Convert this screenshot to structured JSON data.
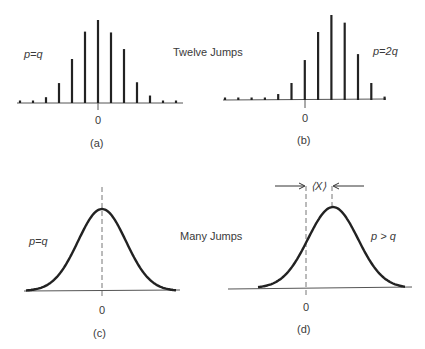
{
  "title_top": "Twelve Jumps",
  "title_bottom": "Many Jumps",
  "chart_data": [
    {
      "type": "bar",
      "panel": "(a)",
      "annotation": "p=q",
      "zero_label": "0",
      "categories": [
        -6,
        -5,
        -4,
        -3,
        -2,
        -1,
        0,
        1,
        2,
        3,
        4,
        5,
        6
      ],
      "values": [
        0.02,
        0.02,
        0.07,
        0.24,
        0.53,
        0.86,
        1.0,
        0.85,
        0.65,
        0.25,
        0.09,
        0.03,
        0.03
      ]
    },
    {
      "type": "bar",
      "panel": "(b)",
      "annotation": "p=2q",
      "zero_label": "0",
      "categories": [
        -6,
        -5,
        -4,
        -3,
        -2,
        -1,
        0,
        1,
        2,
        3,
        4,
        5,
        6
      ],
      "values": [
        0.01,
        0.01,
        0.01,
        0.02,
        0.07,
        0.2,
        0.47,
        0.8,
        1.0,
        0.91,
        0.54,
        0.2,
        0.04
      ]
    },
    {
      "type": "line",
      "panel": "(c)",
      "annotation": "p=q",
      "zero_label": "0",
      "description": "Gaussian centered at 0"
    },
    {
      "type": "line",
      "panel": "(d)",
      "annotation": "p > q",
      "zero_label": "0",
      "mean_label": "⟨X⟩",
      "description": "Gaussian shifted right of 0 by ⟨X⟩"
    }
  ]
}
